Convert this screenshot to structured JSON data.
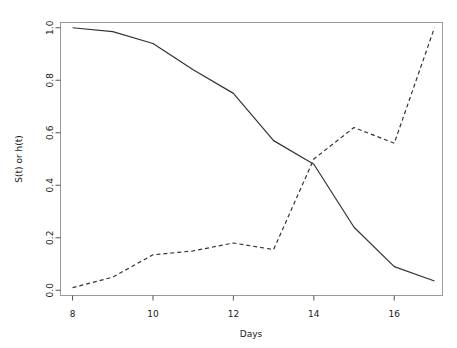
{
  "chart_data": {
    "type": "line",
    "title": "",
    "xlabel": "Days",
    "ylabel": "S(t) or h(t)",
    "xlim": [
      7.7,
      17.2
    ],
    "ylim": [
      -0.02,
      1.02
    ],
    "xticks": [
      8,
      10,
      12,
      14,
      16
    ],
    "xtick_labels": [
      "8",
      "10",
      "12",
      "14",
      "16"
    ],
    "yticks": [
      0.0,
      0.2,
      0.4,
      0.6,
      0.8,
      1.0
    ],
    "ytick_labels": [
      "0.0",
      "0.2",
      "0.4",
      "0.6",
      "0.8",
      "1.0"
    ],
    "grid": false,
    "legend": "none",
    "x": [
      8,
      9,
      10,
      11,
      12,
      13,
      14,
      15,
      16,
      17
    ],
    "series": [
      {
        "name": "S(t)",
        "style": "solid",
        "color": "#333333",
        "values": [
          1.0,
          0.985,
          0.94,
          0.84,
          0.75,
          0.57,
          0.48,
          0.24,
          0.09,
          0.035
        ]
      },
      {
        "name": "h(t)",
        "style": "dashed",
        "color": "#333333",
        "values": [
          0.01,
          0.05,
          0.135,
          0.15,
          0.18,
          0.155,
          0.5,
          0.62,
          0.56,
          1.0
        ]
      }
    ]
  },
  "figure": {
    "background": "#ffffff",
    "frame_color": "#999999",
    "axis_color": "#555555",
    "text_color": "#1a1a1a"
  }
}
